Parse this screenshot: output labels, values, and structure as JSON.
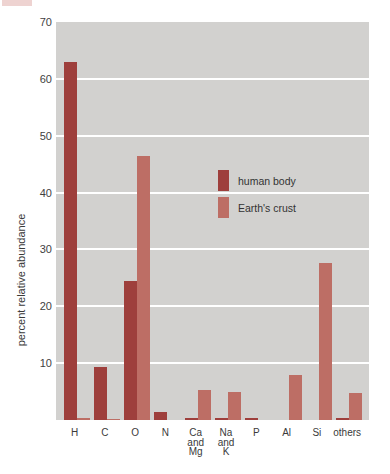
{
  "page": {
    "corner_accent_color": "#eed3d1",
    "background": "#ffffff",
    "text_color": "#3a3a3a"
  },
  "chart_data": {
    "type": "bar",
    "title": "",
    "xlabel": "",
    "ylabel": "percent relative abundance",
    "ylim": [
      0,
      70
    ],
    "yticks": [
      10,
      20,
      30,
      40,
      50,
      60,
      70
    ],
    "grid": "horizontal",
    "gridline_color": "#ffffff",
    "panel_bg": "#d2d1cf",
    "legend_position": "inside-plot upper-middle",
    "categories": [
      "H",
      "C",
      "O",
      "N",
      "Ca and Mg",
      "Na and K",
      "P",
      "Al",
      "Si",
      "others"
    ],
    "series": [
      {
        "name": "human body",
        "color": "#9e3f3c",
        "values": [
          63,
          9.3,
          24.5,
          1.4,
          0.3,
          0.4,
          0.3,
          0,
          0,
          0.3
        ]
      },
      {
        "name": "Earth's crust",
        "color": "#bd6e65",
        "values": [
          0.3,
          0.2,
          46.5,
          0,
          5.3,
          4.9,
          0,
          8,
          27.7,
          4.8
        ]
      }
    ]
  }
}
